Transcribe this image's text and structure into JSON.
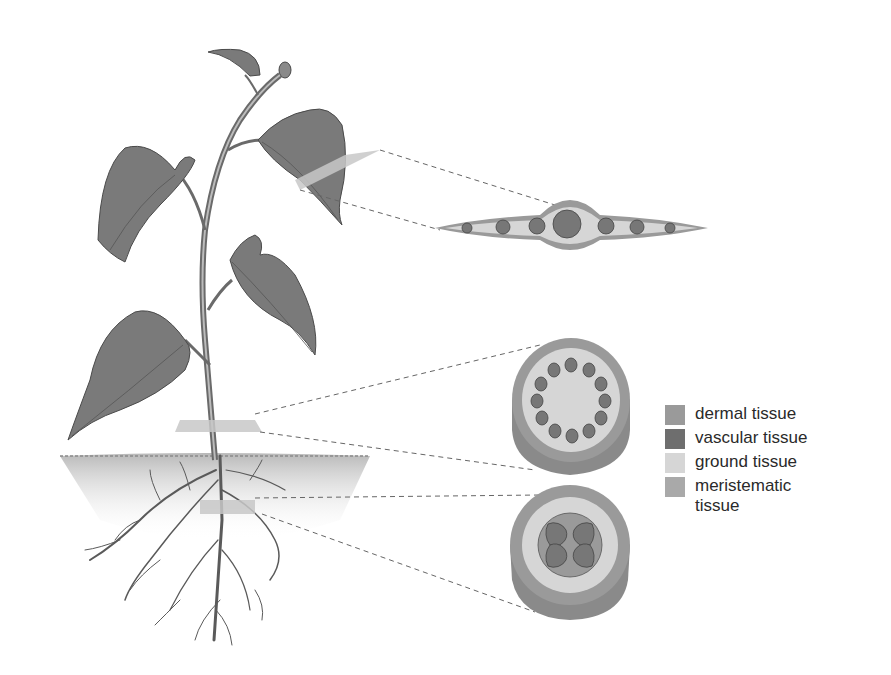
{
  "diagram": {
    "sections": [
      {
        "name": "leaf cross-section"
      },
      {
        "name": "stem cross-section"
      },
      {
        "name": "root cross-section"
      }
    ]
  },
  "legend": {
    "items": [
      {
        "label": "dermal tissue",
        "color": "#9a9a9a"
      },
      {
        "label": "vascular tissue",
        "color": "#6e6e6e"
      },
      {
        "label": "ground tissue",
        "color": "#d6d6d6"
      },
      {
        "label": "meristematic tissue",
        "color": "#a9a9a9"
      }
    ]
  },
  "colors": {
    "dermal": "#9a9a9a",
    "vascular": "#6e6e6e",
    "ground": "#d6d6d6",
    "meristematic": "#a9a9a9",
    "leaf": "#777777",
    "stem": "#6a6a6a"
  }
}
